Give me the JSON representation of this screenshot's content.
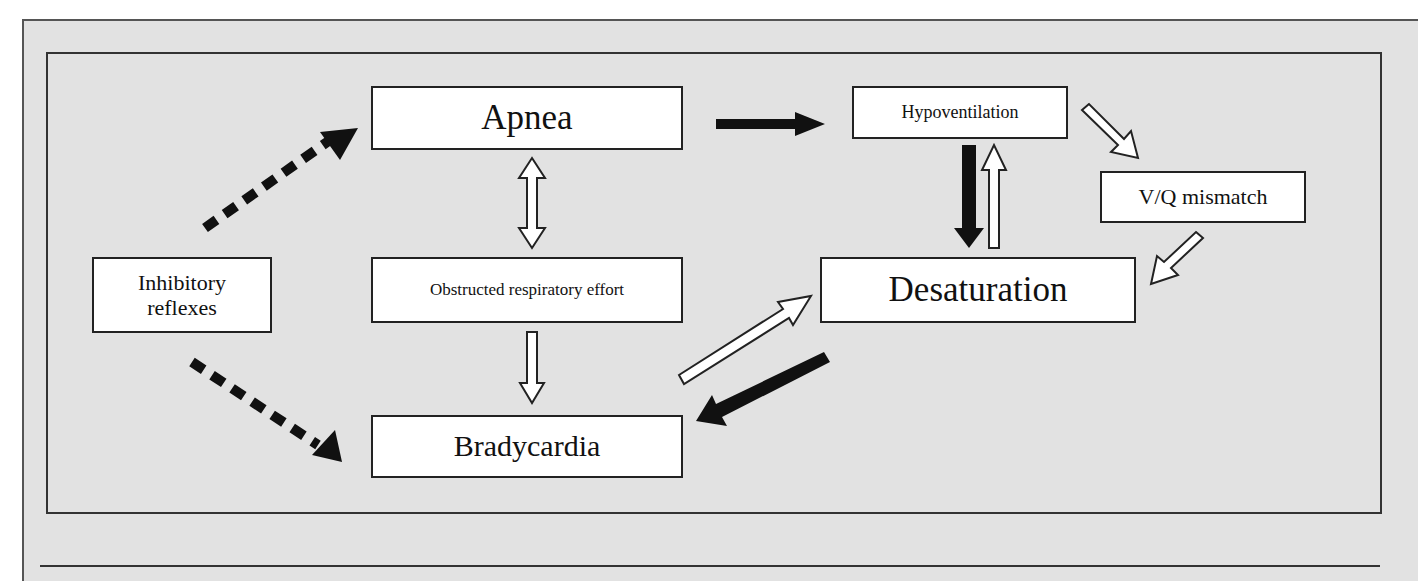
{
  "diagram": {
    "nodes": {
      "apnea": "Apnea",
      "hypoventilation": "Hypoventilation",
      "vq_mismatch": "V/Q mismatch",
      "inhibitory_reflexes_line1": "Inhibitory",
      "inhibitory_reflexes_line2": "reflexes",
      "obstructed_effort": "Obstructed respiratory effort",
      "desaturation": "Desaturation",
      "bradycardia": "Bradycardia"
    },
    "edges": [
      {
        "from": "Inhibitory reflexes",
        "to": "Apnea",
        "style": "dashed-black"
      },
      {
        "from": "Inhibitory reflexes",
        "to": "Bradycardia",
        "style": "dashed-black"
      },
      {
        "from": "Apnea",
        "to": "Hypoventilation",
        "style": "solid-black"
      },
      {
        "from": "Apnea",
        "to": "Obstructed respiratory effort",
        "style": "hollow-bidirectional"
      },
      {
        "from": "Obstructed respiratory effort",
        "to": "Bradycardia",
        "style": "hollow"
      },
      {
        "from": "Hypoventilation",
        "to": "Desaturation",
        "style": "solid-black"
      },
      {
        "from": "Desaturation",
        "to": "Hypoventilation",
        "style": "hollow"
      },
      {
        "from": "Hypoventilation",
        "to": "V/Q mismatch",
        "style": "hollow"
      },
      {
        "from": "V/Q mismatch",
        "to": "Desaturation",
        "style": "hollow"
      },
      {
        "from": "Bradycardia",
        "to": "Desaturation",
        "style": "hollow"
      },
      {
        "from": "Desaturation",
        "to": "Bradycardia",
        "style": "solid-black"
      }
    ],
    "colors": {
      "background": "#e2e2e2",
      "box_fill": "#ffffff",
      "ink": "#111111"
    }
  }
}
